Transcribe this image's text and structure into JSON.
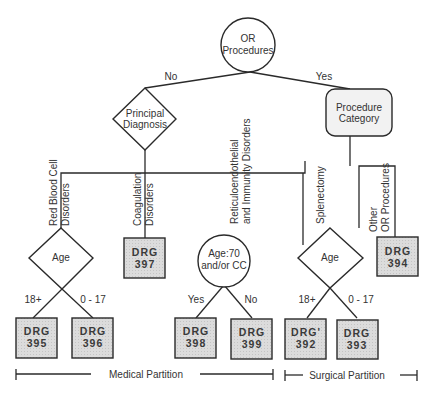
{
  "root": {
    "label_line1": "OR",
    "label_line2": "Procedures"
  },
  "edges": {
    "no": "No",
    "yes": "Yes"
  },
  "principal": {
    "label_line1": "Principal",
    "label_line2": "Diagnosis"
  },
  "procedure_category": {
    "label_line1": "Procedure",
    "label_line2": "Category"
  },
  "branches": {
    "rbc_line1": "Red Blood Cell",
    "rbc_line2": "Disorders",
    "coag_line1": "Coagulation",
    "coag_line2": "Disorders",
    "reti_line1": "Reticuloendothelial",
    "reti_line2": "and Immunity Disorders",
    "splen": "Splenectomy",
    "other_line1": "Other",
    "other_line2": "OR Procedures"
  },
  "age_med": {
    "label": "Age",
    "left": "18+",
    "right": "0 - 17"
  },
  "age70": {
    "label_line1": "Age:70",
    "label_line2": "and/or CC",
    "left": "Yes",
    "right": "No"
  },
  "age_surg": {
    "label": "Age",
    "left": "18+",
    "right": "0 - 17"
  },
  "drg": {
    "d395": {
      "l1": "DRG",
      "l2": "395"
    },
    "d396": {
      "l1": "DRG",
      "l2": "396"
    },
    "d397": {
      "l1": "DRG",
      "l2": "397"
    },
    "d398": {
      "l1": "DRG",
      "l2": "398"
    },
    "d399": {
      "l1": "DRG",
      "l2": "399"
    },
    "d392": {
      "l1": "DRG'",
      "l2": "392"
    },
    "d393": {
      "l1": "DRG",
      "l2": "393"
    },
    "d394": {
      "l1": "DRG",
      "l2": "394"
    }
  },
  "partitions": {
    "medical": "Medical Partition",
    "surgical": "Surgical Partition"
  },
  "colors": {
    "line": "#2a2a2a",
    "box_fill": "#d9d9d9",
    "node_fill": "#ffffff",
    "rounded_fill": "#f2f2f2"
  }
}
